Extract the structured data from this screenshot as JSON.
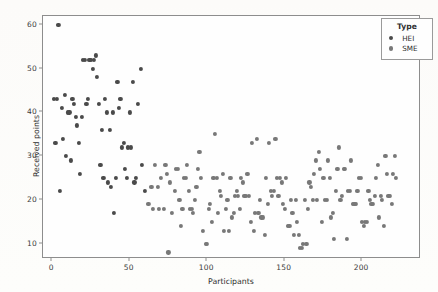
{
  "chart_data": {
    "type": "scatter",
    "title": "",
    "xlabel": "Participants",
    "ylabel": "Received points",
    "xlim": [
      -6,
      238
    ],
    "ylim": [
      6.5,
      62
    ],
    "grid": false,
    "legend_position": "top-right",
    "legend_title": "Type",
    "xticks": [
      0,
      50,
      100,
      150,
      200
    ],
    "yticks": [
      10,
      20,
      30,
      40,
      50,
      60
    ],
    "colors": {
      "HEI": "#4a4a4a",
      "SME": "#787878"
    },
    "series": [
      {
        "name": "HEI",
        "color": "#4a4a4a",
        "points": [
          [
            4,
            60
          ],
          [
            1,
            43
          ],
          [
            3,
            43
          ],
          [
            5,
            22
          ],
          [
            2,
            33
          ],
          [
            6,
            41
          ],
          [
            7,
            34
          ],
          [
            8,
            44
          ],
          [
            9,
            30
          ],
          [
            10,
            40
          ],
          [
            11,
            40
          ],
          [
            12,
            29
          ],
          [
            13,
            43
          ],
          [
            14,
            42
          ],
          [
            15,
            39
          ],
          [
            16,
            37
          ],
          [
            17,
            33
          ],
          [
            18,
            26
          ],
          [
            19,
            39
          ],
          [
            20,
            52
          ],
          [
            21,
            52
          ],
          [
            22,
            42
          ],
          [
            23,
            43
          ],
          [
            24,
            52
          ],
          [
            25,
            52
          ],
          [
            26,
            50
          ],
          [
            27,
            52
          ],
          [
            28,
            53
          ],
          [
            29,
            48
          ],
          [
            30,
            42
          ],
          [
            31,
            28
          ],
          [
            32,
            36
          ],
          [
            33,
            25
          ],
          [
            34,
            43
          ],
          [
            35,
            40
          ],
          [
            36,
            24
          ],
          [
            37,
            36
          ],
          [
            38,
            23
          ],
          [
            39,
            40
          ],
          [
            40,
            17
          ],
          [
            41,
            25
          ],
          [
            42,
            47
          ],
          [
            43,
            41
          ],
          [
            44,
            43
          ],
          [
            45,
            32
          ],
          [
            46,
            33
          ],
          [
            47,
            27
          ],
          [
            48,
            25
          ],
          [
            49,
            32
          ],
          [
            50,
            40
          ],
          [
            51,
            32
          ],
          [
            52,
            47
          ],
          [
            53,
            24
          ],
          [
            54,
            25
          ],
          [
            55,
            42
          ],
          [
            57,
            50
          ],
          [
            58,
            28
          ],
          [
            60,
            22
          ]
        ]
      },
      {
        "name": "SME",
        "color": "#787878",
        "points": [
          [
            62,
            19
          ],
          [
            64,
            23
          ],
          [
            65,
            18
          ],
          [
            66,
            28
          ],
          [
            68,
            23
          ],
          [
            69,
            18
          ],
          [
            70,
            25
          ],
          [
            72,
            18
          ],
          [
            73,
            28
          ],
          [
            74,
            26
          ],
          [
            75,
            8
          ],
          [
            76,
            24
          ],
          [
            77,
            17
          ],
          [
            79,
            22
          ],
          [
            80,
            27
          ],
          [
            81,
            27
          ],
          [
            82,
            20
          ],
          [
            83,
            14
          ],
          [
            84,
            18
          ],
          [
            85,
            25
          ],
          [
            86,
            25
          ],
          [
            87,
            28
          ],
          [
            88,
            22
          ],
          [
            89,
            18
          ],
          [
            90,
            18
          ],
          [
            91,
            17
          ],
          [
            92,
            20
          ],
          [
            93,
            23
          ],
          [
            94,
            27
          ],
          [
            95,
            31
          ],
          [
            96,
            25
          ],
          [
            97,
            13
          ],
          [
            99,
            10
          ],
          [
            100,
            10
          ],
          [
            101,
            18
          ],
          [
            102,
            19
          ],
          [
            103,
            15
          ],
          [
            104,
            25
          ],
          [
            105,
            35
          ],
          [
            106,
            25
          ],
          [
            107,
            17
          ],
          [
            108,
            22
          ],
          [
            109,
            21
          ],
          [
            110,
            26
          ],
          [
            111,
            13
          ],
          [
            112,
            18
          ],
          [
            113,
            20
          ],
          [
            114,
            13
          ],
          [
            115,
            25
          ],
          [
            116,
            16
          ],
          [
            117,
            17
          ],
          [
            118,
            21
          ],
          [
            119,
            22
          ],
          [
            120,
            21
          ],
          [
            121,
            18
          ],
          [
            122,
            25
          ],
          [
            123,
            24
          ],
          [
            124,
            21
          ],
          [
            125,
            21
          ],
          [
            126,
            26
          ],
          [
            127,
            21
          ],
          [
            128,
            15
          ],
          [
            129,
            33
          ],
          [
            130,
            13
          ],
          [
            131,
            17
          ],
          [
            132,
            34
          ],
          [
            133,
            17
          ],
          [
            134,
            20
          ],
          [
            135,
            16
          ],
          [
            136,
            16
          ],
          [
            137,
            12
          ],
          [
            138,
            25
          ],
          [
            139,
            19
          ],
          [
            140,
            33
          ],
          [
            141,
            22
          ],
          [
            142,
            21
          ],
          [
            143,
            22
          ],
          [
            144,
            34
          ],
          [
            145,
            25
          ],
          [
            146,
            21
          ],
          [
            147,
            25
          ],
          [
            148,
            24
          ],
          [
            149,
            19
          ],
          [
            150,
            18
          ],
          [
            151,
            25
          ],
          [
            152,
            14
          ],
          [
            153,
            14
          ],
          [
            154,
            20
          ],
          [
            155,
            17
          ],
          [
            156,
            12
          ],
          [
            157,
            20
          ],
          [
            158,
            15
          ],
          [
            159,
            12
          ],
          [
            160,
            9
          ],
          [
            161,
            9
          ],
          [
            162,
            10
          ],
          [
            163,
            20
          ],
          [
            164,
            10
          ],
          [
            165,
            18
          ],
          [
            166,
            24
          ],
          [
            167,
            23
          ],
          [
            168,
            20
          ],
          [
            169,
            26
          ],
          [
            170,
            29
          ],
          [
            171,
            20
          ],
          [
            172,
            31
          ],
          [
            173,
            27
          ],
          [
            174,
            15
          ],
          [
            175,
            25
          ],
          [
            176,
            20
          ],
          [
            177,
            20
          ],
          [
            178,
            29
          ],
          [
            179,
            25
          ],
          [
            180,
            16
          ],
          [
            181,
            17
          ],
          [
            182,
            11
          ],
          [
            183,
            22
          ],
          [
            184,
            27
          ],
          [
            185,
            32
          ],
          [
            186,
            20
          ],
          [
            187,
            21
          ],
          [
            188,
            27
          ],
          [
            189,
            27
          ],
          [
            190,
            11
          ],
          [
            191,
            22
          ],
          [
            192,
            22
          ],
          [
            193,
            29
          ],
          [
            194,
            19
          ],
          [
            195,
            19
          ],
          [
            196,
            19
          ],
          [
            197,
            22
          ],
          [
            198,
            25
          ],
          [
            199,
            25
          ],
          [
            200,
            15
          ],
          [
            201,
            14
          ],
          [
            202,
            15
          ],
          [
            203,
            15
          ],
          [
            204,
            22
          ],
          [
            205,
            20
          ],
          [
            206,
            19
          ],
          [
            207,
            19
          ],
          [
            208,
            21
          ],
          [
            209,
            25
          ],
          [
            210,
            28
          ],
          [
            211,
            16
          ],
          [
            212,
            21
          ],
          [
            213,
            20
          ],
          [
            214,
            14
          ],
          [
            215,
            30
          ],
          [
            216,
            26
          ],
          [
            217,
            21
          ],
          [
            218,
            21
          ],
          [
            219,
            19
          ],
          [
            220,
            26
          ],
          [
            221,
            30
          ],
          [
            222,
            25
          ]
        ]
      }
    ]
  },
  "legend": {
    "title": "Type",
    "entries": [
      {
        "label": "HEI"
      },
      {
        "label": "SME"
      }
    ]
  },
  "axes": {
    "x_title": "Participants",
    "y_title": "Received points",
    "x_tick_labels": [
      "0",
      "50",
      "100",
      "150",
      "200"
    ],
    "y_tick_labels": [
      "10",
      "20",
      "30",
      "40",
      "50",
      "60"
    ]
  }
}
